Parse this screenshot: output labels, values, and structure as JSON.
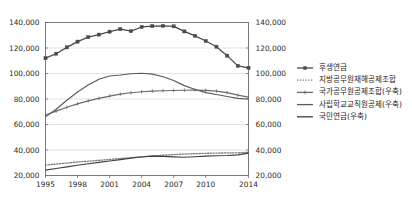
{
  "chart_data": {
    "type": "line",
    "title": "",
    "xlabel": "",
    "ylabel": "",
    "ylim": [
      20000,
      140000
    ],
    "y2lim": [
      20000,
      140000
    ],
    "grid": true,
    "legend_position": "right",
    "x": [
      1995,
      1996,
      1997,
      1998,
      1999,
      2000,
      2001,
      2002,
      2003,
      2004,
      2005,
      2006,
      2007,
      2008,
      2009,
      2010,
      2011,
      2012,
      2013,
      2014
    ],
    "xticks": [
      "1995",
      "1998",
      "2001",
      "2004",
      "2007",
      "2010",
      "2014"
    ],
    "xtick_values": [
      1995,
      1998,
      2001,
      2004,
      2007,
      2010,
      2014
    ],
    "yticks": [
      "20,000",
      "40,000",
      "60,000",
      "80,000",
      "100,000",
      "120,000",
      "140,000"
    ],
    "ytick_values": [
      20000,
      40000,
      60000,
      80000,
      100000,
      120000,
      140000
    ],
    "y2ticks": [
      "20,000",
      "40,000",
      "60,000",
      "80,000",
      "100,000",
      "120,000",
      "140,000"
    ],
    "y2tick_values": [
      20000,
      40000,
      60000,
      80000,
      100000,
      120000,
      140000
    ],
    "series": [
      {
        "name": "후생연금",
        "axis": "left",
        "marker": "square",
        "color": "#4a4a4a",
        "values": [
          112000,
          115500,
          120500,
          125000,
          128500,
          130500,
          132800,
          134800,
          133200,
          136500,
          137200,
          137300,
          137000,
          133000,
          129500,
          125500,
          121000,
          114000,
          106000,
          104500
        ]
      },
      {
        "name": "지방공무원재해공제조합",
        "axis": "left",
        "marker": "dotted",
        "color": "#7a7a7a",
        "values": [
          28200,
          29000,
          29800,
          30600,
          31200,
          31900,
          32600,
          33300,
          34000,
          34700,
          35300,
          35900,
          36400,
          36800,
          37100,
          37400,
          37600,
          37700,
          37800,
          38200
        ]
      },
      {
        "name": "국가공무원공제조합(우축)",
        "axis": "right",
        "marker": "tick",
        "color": "#6a6a6a",
        "values": [
          67500,
          70500,
          73500,
          76200,
          78500,
          80500,
          82300,
          83800,
          84900,
          85700,
          86200,
          86500,
          86700,
          86900,
          87000,
          86800,
          86200,
          85000,
          83000,
          81500
        ]
      },
      {
        "name": "사립학교교직원공제(우축)",
        "axis": "right",
        "marker": "none",
        "color": "#5a5a5a",
        "values": [
          66000,
          72000,
          79000,
          85500,
          91000,
          95500,
          98000,
          98800,
          99800,
          100200,
          99500,
          97500,
          94500,
          90500,
          87500,
          85000,
          83500,
          82000,
          80500,
          80000
        ]
      },
      {
        "name": "국민연금(우축)",
        "axis": "right",
        "marker": "none",
        "color": "#3f3f3f",
        "values": [
          24200,
          25500,
          26800,
          28000,
          29200,
          30300,
          31400,
          32500,
          33600,
          34500,
          35200,
          35000,
          34600,
          34300,
          34700,
          35200,
          35500,
          35700,
          36200,
          37500
        ]
      }
    ]
  },
  "legend": {
    "items": [
      {
        "label": "후생연금",
        "style": "line-square"
      },
      {
        "label": "지방공무원재해공제조합",
        "style": "dotted"
      },
      {
        "label": "국가공무원공제조합(우축)",
        "style": "line-tick"
      },
      {
        "label": "사립학교교직원공제(우축)",
        "style": "line"
      },
      {
        "label": "국민연금(우축)",
        "style": "line"
      }
    ]
  }
}
